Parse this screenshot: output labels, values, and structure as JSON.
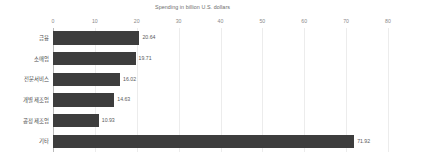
{
  "chart_data": {
    "type": "bar",
    "orientation": "horizontal",
    "title": "Spending in billion U.S. dollars",
    "xlabel": "",
    "ylabel": "",
    "xlim": [
      0,
      80
    ],
    "xticks": [
      0,
      10,
      20,
      30,
      40,
      50,
      60,
      70,
      80
    ],
    "xtick_labels": [
      "0",
      "10",
      "20",
      "30",
      "40",
      "50",
      "60",
      "70",
      "80"
    ],
    "grid": true,
    "legend": null,
    "bar_color": "#3d3d3d",
    "categories": [
      "금융",
      "소매업",
      "전문서비스",
      "개별 제조업",
      "공정 제조업",
      "기타"
    ],
    "values": [
      20.64,
      19.71,
      16.02,
      14.63,
      10.93,
      71.92
    ],
    "value_labels": [
      "20.64",
      "19.71",
      "16.02",
      "14.63",
      "10.93",
      "71.92"
    ]
  }
}
